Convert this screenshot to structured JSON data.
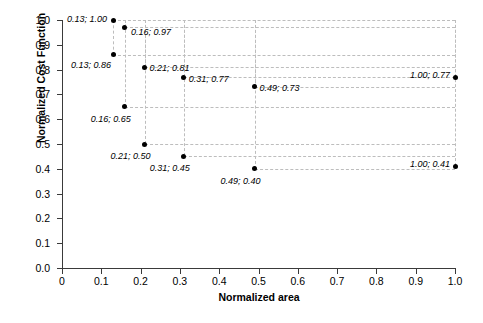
{
  "chart_data": {
    "type": "scatter",
    "title": "",
    "xlabel": "Normalized area",
    "ylabel": "Normalized Cost Function",
    "xlim": [
      0,
      1.0
    ],
    "ylim": [
      0,
      1.0
    ],
    "grid": true,
    "legend": "none",
    "x": [
      0.13,
      0.16,
      0.13,
      0.21,
      0.31,
      0.16,
      0.49,
      1.0,
      0.21,
      0.31,
      0.49,
      1.0
    ],
    "y": [
      1.0,
      0.97,
      0.86,
      0.81,
      0.77,
      0.65,
      0.73,
      0.77,
      0.5,
      0.45,
      0.4,
      0.41
    ],
    "points": [
      {
        "x": 0.13,
        "y": 1.0,
        "label": "0.13; 1.00",
        "label_side": "left",
        "label_dx": -6,
        "label_dy": -1
      },
      {
        "x": 0.16,
        "y": 0.97,
        "label": "0.16; 0.97",
        "label_side": "right",
        "label_dx": 6,
        "label_dy": 5
      },
      {
        "x": 0.13,
        "y": 0.86,
        "label": "0.13; 0.86",
        "label_side": "left",
        "label_dx": -2,
        "label_dy": 10
      },
      {
        "x": 0.21,
        "y": 0.81,
        "label": "0.21; 0.81",
        "label_side": "right",
        "label_dx": 5,
        "label_dy": 1
      },
      {
        "x": 0.31,
        "y": 0.77,
        "label": "0.31; 0.77",
        "label_side": "right",
        "label_dx": 5,
        "label_dy": 2
      },
      {
        "x": 0.49,
        "y": 0.73,
        "label": "0.49; 0.73",
        "label_side": "right",
        "label_dx": 5,
        "label_dy": 1
      },
      {
        "x": 1.0,
        "y": 0.77,
        "label": "1.00; 0.77",
        "label_side": "left",
        "label_dx": -5,
        "label_dy": -2
      },
      {
        "x": 0.16,
        "y": 0.65,
        "label": "0.16; 0.65",
        "label_side": "left",
        "label_dx": 6,
        "label_dy": 12
      },
      {
        "x": 0.21,
        "y": 0.5,
        "label": "0.21; 0.50",
        "label_side": "left",
        "label_dx": 6,
        "label_dy": 12
      },
      {
        "x": 0.31,
        "y": 0.45,
        "label": "0.31; 0.45",
        "label_side": "left",
        "label_dx": 6,
        "label_dy": 12
      },
      {
        "x": 0.49,
        "y": 0.4,
        "label": "0.49; 0.40",
        "label_side": "left",
        "label_dx": 6,
        "label_dy": 12
      },
      {
        "x": 1.0,
        "y": 0.41,
        "label": "1.00; 0.41",
        "label_side": "left",
        "label_dx": -5,
        "label_dy": -2
      }
    ],
    "xticks": [
      {
        "value": 0.0,
        "label": "0"
      },
      {
        "value": 0.1,
        "label": "0.1"
      },
      {
        "value": 0.2,
        "label": "0.2"
      },
      {
        "value": 0.3,
        "label": "0.3"
      },
      {
        "value": 0.4,
        "label": "0.4"
      },
      {
        "value": 0.5,
        "label": "0.5"
      },
      {
        "value": 0.6,
        "label": "0.6"
      },
      {
        "value": 0.7,
        "label": "0.7"
      },
      {
        "value": 0.8,
        "label": "0.8"
      },
      {
        "value": 0.9,
        "label": "0.9"
      },
      {
        "value": 1.0,
        "label": "1.0"
      }
    ],
    "yticks": [
      {
        "value": 0.0,
        "label": "0.0"
      },
      {
        "value": 0.1,
        "label": "0.1"
      },
      {
        "value": 0.2,
        "label": "0.2"
      },
      {
        "value": 0.3,
        "label": "0.3"
      },
      {
        "value": 0.4,
        "label": "0.4"
      },
      {
        "value": 0.5,
        "label": "0.5"
      },
      {
        "value": 0.6,
        "label": "0.6"
      },
      {
        "value": 0.7,
        "label": "0.7"
      },
      {
        "value": 0.8,
        "label": "0.8"
      },
      {
        "value": 0.9,
        "label": "0.9"
      },
      {
        "value": 1.0,
        "label": "1.0"
      }
    ],
    "colors": {
      "marker": "#000000",
      "axis": "#3a3a3a",
      "grid": "#bdbdbd",
      "background": "#ffffff",
      "text": "#000000"
    }
  }
}
